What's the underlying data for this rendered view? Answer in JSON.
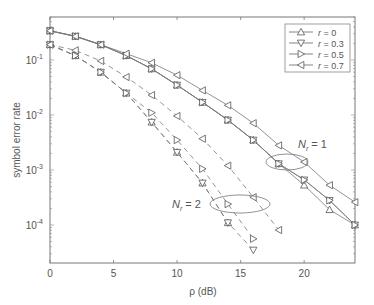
{
  "chart_data": {
    "type": "line",
    "title": "",
    "xlabel": "ρ (dB)",
    "ylabel": "symbol error rate",
    "yscale": "log",
    "xlim": [
      0,
      24
    ],
    "ylim": [
      2e-05,
      0.6
    ],
    "x_ticks": [
      0,
      5,
      10,
      15,
      20
    ],
    "y_ticks": [
      "10^-1",
      "10^-2",
      "10^-3",
      "10^-4"
    ],
    "grid": false,
    "legend_position": "upper right",
    "legend": [
      {
        "label": "r = 0",
        "marker": "triangle-up"
      },
      {
        "label": "r = 0.3",
        "marker": "triangle-down"
      },
      {
        "label": "r = 0.5",
        "marker": "triangle-right"
      },
      {
        "label": "r = 0.7",
        "marker": "triangle-left"
      }
    ],
    "annotations": [
      {
        "text": "N_r = 1",
        "target": "solid curves",
        "ellipse": true
      },
      {
        "text": "N_r = 2",
        "target": "dashed curves",
        "ellipse": true
      }
    ],
    "x": [
      0,
      2,
      4,
      6,
      8,
      10,
      12,
      14,
      16,
      18,
      20,
      22,
      24
    ],
    "series": [
      {
        "name": "Nr=1, r=0",
        "style": "solid",
        "marker": "triangle-up",
        "x": [
          0,
          2,
          4,
          6,
          8,
          10,
          12,
          14,
          16,
          18,
          20,
          22,
          24
        ],
        "values": [
          0.34,
          0.27,
          0.19,
          0.12,
          0.069,
          0.035,
          0.017,
          0.0081,
          0.0035,
          0.0013,
          0.00053,
          0.00019,
          0.0001
        ]
      },
      {
        "name": "Nr=1, r=0.3",
        "style": "solid",
        "marker": "triangle-down",
        "x": [
          0,
          2,
          4,
          6,
          8,
          10,
          12,
          14,
          16,
          18,
          20,
          22,
          24
        ],
        "values": [
          0.34,
          0.27,
          0.19,
          0.12,
          0.069,
          0.035,
          0.017,
          0.0081,
          0.0035,
          0.0013,
          0.00066,
          0.00028,
          0.0001
        ]
      },
      {
        "name": "Nr=1, r=0.5",
        "style": "solid",
        "marker": "triangle-right",
        "x": [
          0,
          2,
          4,
          6,
          8,
          10,
          12,
          14,
          16,
          18,
          20,
          22,
          24
        ],
        "values": [
          0.34,
          0.27,
          0.19,
          0.12,
          0.069,
          0.035,
          0.017,
          0.0081,
          0.0035,
          0.0013,
          0.00066,
          0.00028,
          0.0001
        ]
      },
      {
        "name": "Nr=1, r=0.7",
        "style": "solid",
        "marker": "triangle-left",
        "x": [
          0,
          2,
          4,
          6,
          8,
          10,
          12,
          14,
          16,
          18,
          20,
          22,
          24
        ],
        "values": [
          0.34,
          0.27,
          0.19,
          0.13,
          0.089,
          0.053,
          0.028,
          0.015,
          0.0071,
          0.0028,
          0.0014,
          0.00053,
          0.00026
        ]
      },
      {
        "name": "Nr=2, r=0",
        "style": "dashed",
        "marker": "triangle-up",
        "x": [
          0,
          2,
          4,
          6,
          8,
          10,
          12,
          14
        ],
        "values": [
          0.19,
          0.12,
          0.06,
          0.025,
          0.0074,
          0.0021,
          0.00058,
          0.00011
        ]
      },
      {
        "name": "Nr=2, r=0.3",
        "style": "dashed",
        "marker": "triangle-down",
        "x": [
          0,
          2,
          4,
          6,
          8,
          10,
          12,
          14,
          16
        ],
        "values": [
          0.19,
          0.12,
          0.06,
          0.025,
          0.0074,
          0.0021,
          0.00058,
          0.00011,
          3.5e-05
        ]
      },
      {
        "name": "Nr=2, r=0.5",
        "style": "dashed",
        "marker": "triangle-right",
        "x": [
          0,
          2,
          4,
          6,
          8,
          10,
          12,
          14,
          16
        ],
        "values": [
          0.19,
          0.12,
          0.06,
          0.025,
          0.011,
          0.0035,
          0.00105,
          0.00024,
          5.6e-05
        ]
      },
      {
        "name": "Nr=2, r=0.7",
        "style": "dashed",
        "marker": "triangle-left",
        "x": [
          0,
          2,
          4,
          6,
          8,
          10,
          12,
          14,
          16,
          18
        ],
        "values": [
          0.19,
          0.15,
          0.096,
          0.049,
          0.023,
          0.0096,
          0.0037,
          0.0012,
          0.00032,
          8.1e-05
        ]
      }
    ]
  },
  "labels": {
    "xlabel": "ρ (dB)",
    "ylabel": "symbol error rate",
    "xticks": [
      "0",
      "5",
      "10",
      "15",
      "20"
    ],
    "ytick_base": "10",
    "yticks_exp": [
      "-1",
      "-2",
      "-3",
      "-4"
    ],
    "legend": [
      "r = 0",
      "r = 0.3",
      "r = 0.5",
      "r = 0.7"
    ],
    "nr1": "N",
    "nr1_sub": "r",
    "nr1_val": " = 1",
    "nr2": "N",
    "nr2_sub": "r",
    "nr2_val": " = 2"
  }
}
